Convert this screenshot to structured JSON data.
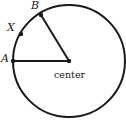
{
  "diagram": {
    "type": "circle-sector",
    "circle": {
      "cx": 69,
      "cy": 61,
      "r": 56,
      "stroke": "#1a1a1a"
    },
    "points": [
      {
        "name": "A",
        "label": "A",
        "x": 13,
        "y": 61
      },
      {
        "name": "B",
        "label": "B",
        "x": 41,
        "y": 15
      },
      {
        "name": "X",
        "label": "X",
        "x": 21,
        "y": 34
      }
    ],
    "center": {
      "label": "center",
      "x": 69,
      "y": 61
    },
    "segments": [
      {
        "from": "A",
        "to": "center"
      },
      {
        "from": "B",
        "to": "center"
      }
    ]
  }
}
